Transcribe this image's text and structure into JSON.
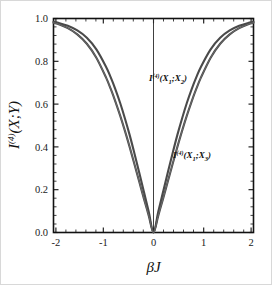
{
  "chart_data": {
    "type": "line",
    "title": "",
    "xlabel": "βJ",
    "ylabel": "I⁽⁴⁾(X;Y)",
    "ylabel_base": "I",
    "ylabel_sup": "(4)",
    "ylabel_args": "(X;Y)",
    "xlim": [
      -2.1,
      2.1
    ],
    "ylim": [
      0.0,
      1.0
    ],
    "grid": false,
    "legend_position": "inline-annotations",
    "xticks": [
      -2,
      -1,
      0,
      1,
      2
    ],
    "xtick_labels": [
      "-2",
      "-1",
      "0",
      "1",
      "2"
    ],
    "yticks": [
      0.0,
      0.2,
      0.4,
      0.6,
      0.8,
      1.0
    ],
    "ytick_labels": [
      "0.0",
      "0.2",
      "0.4",
      "0.6",
      "0.8",
      "1.0"
    ],
    "minor_ticks": true,
    "zero_vertical_line": true,
    "series": [
      {
        "name": "I(4)(X1;X2)",
        "label_base": "I",
        "label_sup": "(4)",
        "label_args": "(X",
        "label_sub1": "1",
        "label_mid": ";X",
        "label_sub2": "2",
        "label_end": ")",
        "color": "#4a4a4a",
        "x": [
          -2.1,
          -2.0,
          -1.8,
          -1.6,
          -1.4,
          -1.2,
          -1.0,
          -0.9,
          -0.8,
          -0.7,
          -0.6,
          -0.5,
          -0.4,
          -0.3,
          -0.2,
          -0.1,
          0.0,
          0.1,
          0.2,
          0.3,
          0.4,
          0.5,
          0.6,
          0.7,
          0.8,
          0.9,
          1.0,
          1.2,
          1.4,
          1.6,
          1.8,
          2.0,
          2.1
        ],
        "y": [
          0.985,
          0.98,
          0.966,
          0.944,
          0.91,
          0.856,
          0.776,
          0.726,
          0.669,
          0.605,
          0.533,
          0.455,
          0.369,
          0.28,
          0.189,
          0.097,
          0.0,
          0.097,
          0.189,
          0.28,
          0.369,
          0.455,
          0.533,
          0.605,
          0.669,
          0.726,
          0.776,
          0.856,
          0.91,
          0.944,
          0.966,
          0.98,
          0.985
        ]
      },
      {
        "name": "I(4)(X1;X3)",
        "label_base": "I",
        "label_sup": "(4)",
        "label_args": "(X",
        "label_sub1": "1",
        "label_mid": ";X",
        "label_sub2": "3",
        "label_end": ")",
        "color": "#6e6e6e",
        "x": [
          -2.1,
          -2.0,
          -1.8,
          -1.6,
          -1.4,
          -1.2,
          -1.0,
          -0.9,
          -0.8,
          -0.7,
          -0.6,
          -0.5,
          -0.4,
          -0.3,
          -0.2,
          -0.1,
          0.0,
          0.1,
          0.2,
          0.3,
          0.4,
          0.5,
          0.6,
          0.7,
          0.8,
          0.9,
          1.0,
          1.2,
          1.4,
          1.6,
          1.8,
          2.0,
          2.1
        ],
        "y": [
          0.98,
          0.974,
          0.955,
          0.926,
          0.882,
          0.817,
          0.726,
          0.672,
          0.612,
          0.546,
          0.475,
          0.399,
          0.319,
          0.238,
          0.157,
          0.079,
          0.0,
          0.079,
          0.157,
          0.238,
          0.319,
          0.399,
          0.475,
          0.546,
          0.612,
          0.672,
          0.726,
          0.817,
          0.882,
          0.926,
          0.955,
          0.974,
          0.98
        ]
      }
    ],
    "annotations": [
      {
        "text": "I(4)(X1;X2)",
        "x_px": 148,
        "y_px": 78
      },
      {
        "text": "I(4)(X1;X3)",
        "x_px": 172,
        "y_px": 155
      }
    ]
  }
}
